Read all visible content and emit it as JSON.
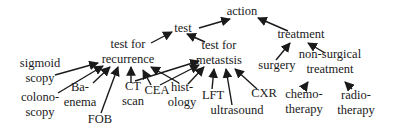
{
  "diagram": {
    "type": "concept-hierarchy",
    "colors": {
      "ink": "#1a1a1a",
      "background": "#ffffff"
    },
    "nodes": [
      {
        "id": "action",
        "lines": [
          "action"
        ],
        "x": 242,
        "y": 15
      },
      {
        "id": "test",
        "lines": [
          "test"
        ],
        "x": 183,
        "y": 32
      },
      {
        "id": "treatment",
        "lines": [
          "treatment"
        ],
        "x": 301,
        "y": 38
      },
      {
        "id": "test_recurrence",
        "lines": [
          "test for",
          "recurrence"
        ],
        "x": 128,
        "y": 48
      },
      {
        "id": "test_metastasis",
        "lines": [
          "test for",
          "metastsis"
        ],
        "x": 219,
        "y": 49
      },
      {
        "id": "surgery",
        "lines": [
          "surgery"
        ],
        "x": 277,
        "y": 69
      },
      {
        "id": "non_surgical",
        "lines": [
          "non-surgical",
          "treatment"
        ],
        "x": 330,
        "y": 58
      },
      {
        "id": "sigmoidscopy",
        "lines": [
          "sigmoid",
          "scopy"
        ],
        "x": 40,
        "y": 67
      },
      {
        "id": "colonoscopy",
        "lines": [
          "colono-",
          "scopy"
        ],
        "x": 40,
        "y": 101
      },
      {
        "id": "ba_enema",
        "lines": [
          "Ba-",
          "enema"
        ],
        "x": 80,
        "y": 91
      },
      {
        "id": "fob",
        "lines": [
          "FOB"
        ],
        "x": 100,
        "y": 123
      },
      {
        "id": "ct_scan",
        "lines": [
          "CT",
          "scan"
        ],
        "x": 133,
        "y": 90
      },
      {
        "id": "cea",
        "lines": [
          "CEA"
        ],
        "x": 157,
        "y": 94
      },
      {
        "id": "histology",
        "lines": [
          "hist-",
          "ology"
        ],
        "x": 182,
        "y": 91
      },
      {
        "id": "lft",
        "lines": [
          "LFT"
        ],
        "x": 213,
        "y": 99
      },
      {
        "id": "ultrasound",
        "lines": [
          "ultrasound"
        ],
        "x": 237,
        "y": 114
      },
      {
        "id": "cxr",
        "lines": [
          "CXR"
        ],
        "x": 264,
        "y": 97
      },
      {
        "id": "chemotherapy",
        "lines": [
          "chemo-",
          "therapy"
        ],
        "x": 304,
        "y": 98
      },
      {
        "id": "radiotherapy",
        "lines": [
          "radio-",
          "therapy"
        ],
        "x": 356,
        "y": 99
      }
    ],
    "edges": [
      {
        "from": "test",
        "to": "action",
        "x1": 199,
        "y1": 28,
        "x2": 230,
        "y2": 19
      },
      {
        "from": "treatment",
        "to": "action",
        "x1": 288,
        "y1": 31,
        "x2": 258,
        "y2": 18
      },
      {
        "from": "test_recurrence",
        "to": "test",
        "x1": 151,
        "y1": 43,
        "x2": 172,
        "y2": 32
      },
      {
        "from": "test_metastasis",
        "to": "test",
        "x1": 205,
        "y1": 42,
        "x2": 187,
        "y2": 34
      },
      {
        "from": "surgery",
        "to": "treatment",
        "x1": 276,
        "y1": 60,
        "x2": 290,
        "y2": 43
      },
      {
        "from": "non_surgical",
        "to": "treatment",
        "x1": 325,
        "y1": 53,
        "x2": 308,
        "y2": 43
      },
      {
        "from": "sigmoidscopy",
        "to": "test_recurrence",
        "x1": 55,
        "y1": 75,
        "x2": 98,
        "y2": 63
      },
      {
        "from": "colonoscopy",
        "to": "test_recurrence",
        "x1": 58,
        "y1": 93,
        "x2": 103,
        "y2": 66
      },
      {
        "from": "ba_enema",
        "to": "test_recurrence",
        "x1": 93,
        "y1": 83,
        "x2": 110,
        "y2": 67
      },
      {
        "from": "fob",
        "to": "test_recurrence",
        "x1": 101,
        "y1": 113,
        "x2": 118,
        "y2": 67
      },
      {
        "from": "ct_scan",
        "to": "test_recurrence",
        "x1": 131,
        "y1": 83,
        "x2": 131,
        "y2": 67
      },
      {
        "from": "cea",
        "to": "test_recurrence",
        "x1": 151,
        "y1": 85,
        "x2": 143,
        "y2": 70
      },
      {
        "from": "histology",
        "to": "test_recurrence",
        "x1": 179,
        "y1": 83,
        "x2": 151,
        "y2": 67
      },
      {
        "from": "ct_scan",
        "to": "test_metastasis",
        "x1": 135,
        "y1": 81,
        "x2": 199,
        "y2": 61
      },
      {
        "from": "cea",
        "to": "test_metastasis",
        "x1": 160,
        "y1": 85,
        "x2": 199,
        "y2": 65
      },
      {
        "from": "histology",
        "to": "test_metastasis",
        "x1": 188,
        "y1": 84,
        "x2": 204,
        "y2": 67
      },
      {
        "from": "lft",
        "to": "test_metastasis",
        "x1": 212,
        "y1": 89,
        "x2": 214,
        "y2": 69
      },
      {
        "from": "ultrasound",
        "to": "test_metastasis",
        "x1": 232,
        "y1": 105,
        "x2": 226,
        "y2": 69
      },
      {
        "from": "cxr",
        "to": "test_metastasis",
        "x1": 257,
        "y1": 89,
        "x2": 235,
        "y2": 69
      },
      {
        "from": "chemotherapy",
        "to": "non_surgical",
        "x1": 303,
        "y1": 89,
        "x2": 308,
        "y2": 82
      },
      {
        "from": "radiotherapy",
        "to": "non_surgical",
        "x1": 352,
        "y1": 89,
        "x2": 345,
        "y2": 82
      }
    ]
  }
}
